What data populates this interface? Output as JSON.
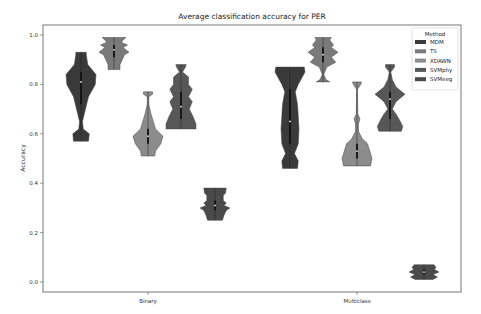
{
  "chart_data": {
    "type": "violin",
    "title": "Average classification accuracy for PER",
    "xlabel": "",
    "ylabel": "Accuracy",
    "ylim": [
      -0.04,
      1.04
    ],
    "yticks": [
      "0.0",
      "0.2",
      "0.4",
      "0.6",
      "0.8",
      "1.0"
    ],
    "categories": [
      "Binary",
      "Multiclass"
    ],
    "grid": false,
    "legend": {
      "title": "Method",
      "position": "upper right"
    },
    "series": [
      {
        "name": "MDM",
        "color": "#3a3a3a",
        "values": [
          {
            "min": 0.57,
            "max": 0.93,
            "median": 0.81,
            "q1": 0.72,
            "q3": 0.85,
            "profile": [
              [
                0.57,
                0.5
              ],
              [
                0.6,
                0.55
              ],
              [
                0.62,
                0.15
              ],
              [
                0.65,
                0.1
              ],
              [
                0.7,
                0.3
              ],
              [
                0.75,
                0.5
              ],
              [
                0.8,
                0.95
              ],
              [
                0.84,
                1.0
              ],
              [
                0.88,
                0.45
              ],
              [
                0.92,
                0.35
              ],
              [
                0.93,
                0.35
              ]
            ]
          },
          {
            "min": 0.46,
            "max": 0.87,
            "median": 0.65,
            "q1": 0.56,
            "q3": 0.78,
            "profile": [
              [
                0.46,
                0.5
              ],
              [
                0.49,
                0.55
              ],
              [
                0.52,
                0.3
              ],
              [
                0.56,
                0.55
              ],
              [
                0.62,
                0.6
              ],
              [
                0.67,
                0.55
              ],
              [
                0.72,
                0.5
              ],
              [
                0.77,
                0.35
              ],
              [
                0.8,
                0.55
              ],
              [
                0.85,
                1.0
              ],
              [
                0.87,
                0.95
              ]
            ]
          }
        ]
      },
      {
        "name": "TS",
        "color": "#7a7a7a",
        "values": [
          {
            "min": 0.86,
            "max": 0.99,
            "median": 0.94,
            "q1": 0.91,
            "q3": 0.96,
            "profile": [
              [
                0.86,
                0.4
              ],
              [
                0.88,
                0.4
              ],
              [
                0.9,
                0.55
              ],
              [
                0.92,
                0.7
              ],
              [
                0.93,
                1.0
              ],
              [
                0.95,
                0.6
              ],
              [
                0.96,
                0.9
              ],
              [
                0.97,
                0.5
              ],
              [
                0.98,
                0.6
              ],
              [
                0.99,
                0.8
              ]
            ]
          },
          {
            "min": 0.81,
            "max": 0.99,
            "median": 0.92,
            "q1": 0.89,
            "q3": 0.95,
            "profile": [
              [
                0.81,
                0.45
              ],
              [
                0.82,
                0.2
              ],
              [
                0.84,
                0.05
              ],
              [
                0.87,
                0.25
              ],
              [
                0.89,
                0.85
              ],
              [
                0.91,
                0.55
              ],
              [
                0.93,
                1.0
              ],
              [
                0.95,
                0.55
              ],
              [
                0.96,
                0.7
              ],
              [
                0.98,
                0.45
              ],
              [
                0.99,
                0.55
              ]
            ]
          }
        ]
      },
      {
        "name": "XDAWN",
        "color": "#8c8c8c",
        "values": [
          {
            "min": 0.51,
            "max": 0.77,
            "median": 0.59,
            "q1": 0.56,
            "q3": 0.62,
            "profile": [
              [
                0.51,
                0.45
              ],
              [
                0.53,
                0.5
              ],
              [
                0.56,
                0.85
              ],
              [
                0.59,
                1.0
              ],
              [
                0.62,
                0.5
              ],
              [
                0.65,
                0.35
              ],
              [
                0.68,
                0.2
              ],
              [
                0.72,
                0.05
              ],
              [
                0.75,
                0.05
              ],
              [
                0.76,
                0.3
              ],
              [
                0.77,
                0.3
              ]
            ]
          },
          {
            "min": 0.47,
            "max": 0.81,
            "median": 0.53,
            "q1": 0.5,
            "q3": 0.56,
            "profile": [
              [
                0.47,
                0.9
              ],
              [
                0.5,
                1.0
              ],
              [
                0.53,
                0.85
              ],
              [
                0.56,
                0.7
              ],
              [
                0.58,
                0.35
              ],
              [
                0.61,
                0.1
              ],
              [
                0.64,
                0.1
              ],
              [
                0.66,
                0.2
              ],
              [
                0.68,
                0.05
              ],
              [
                0.78,
                0.03
              ],
              [
                0.8,
                0.25
              ],
              [
                0.81,
                0.3
              ]
            ]
          }
        ]
      },
      {
        "name": "SVMphy",
        "color": "#575757",
        "values": [
          {
            "min": 0.62,
            "max": 0.88,
            "median": 0.71,
            "q1": 0.66,
            "q3": 0.77,
            "profile": [
              [
                0.62,
                1.0
              ],
              [
                0.64,
                1.0
              ],
              [
                0.67,
                0.8
              ],
              [
                0.7,
                0.55
              ],
              [
                0.73,
                0.75
              ],
              [
                0.75,
                0.5
              ],
              [
                0.78,
                0.75
              ],
              [
                0.8,
                0.5
              ],
              [
                0.83,
                0.5
              ],
              [
                0.85,
                0.1
              ],
              [
                0.87,
                0.3
              ],
              [
                0.88,
                0.35
              ]
            ]
          },
          {
            "min": 0.61,
            "max": 0.88,
            "median": 0.74,
            "q1": 0.66,
            "q3": 0.77,
            "profile": [
              [
                0.61,
                0.75
              ],
              [
                0.63,
                0.85
              ],
              [
                0.66,
                0.6
              ],
              [
                0.68,
                0.4
              ],
              [
                0.7,
                0.15
              ],
              [
                0.73,
                0.4
              ],
              [
                0.76,
                1.0
              ],
              [
                0.79,
                0.4
              ],
              [
                0.82,
                0.15
              ],
              [
                0.85,
                0.05
              ],
              [
                0.87,
                0.3
              ],
              [
                0.88,
                0.3
              ]
            ]
          }
        ]
      },
      {
        "name": "SVMeeg",
        "color": "#4a4a4a",
        "values": [
          {
            "min": 0.25,
            "max": 0.38,
            "median": 0.31,
            "q1": 0.29,
            "q3": 0.33,
            "profile": [
              [
                0.25,
                0.5
              ],
              [
                0.27,
                0.6
              ],
              [
                0.29,
                0.75
              ],
              [
                0.3,
                1.0
              ],
              [
                0.31,
                0.6
              ],
              [
                0.32,
                0.75
              ],
              [
                0.33,
                0.55
              ],
              [
                0.35,
                0.55
              ],
              [
                0.36,
                0.7
              ],
              [
                0.38,
                0.75
              ]
            ]
          },
          {
            "min": 0.01,
            "max": 0.07,
            "median": 0.04,
            "q1": 0.03,
            "q3": 0.05,
            "profile": [
              [
                0.01,
                0.6
              ],
              [
                0.02,
                0.9
              ],
              [
                0.03,
                0.6
              ],
              [
                0.04,
                1.0
              ],
              [
                0.05,
                0.7
              ],
              [
                0.06,
                0.8
              ],
              [
                0.07,
                0.65
              ]
            ]
          }
        ]
      }
    ]
  }
}
